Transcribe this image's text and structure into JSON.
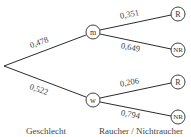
{
  "diagram": {
    "type": "probability-tree",
    "root": {
      "x": 4,
      "y": 66
    },
    "level1": [
      {
        "id": "m",
        "label": "m",
        "x": 93,
        "y": 32,
        "probability": "0,478"
      },
      {
        "id": "w",
        "label": "w",
        "x": 93,
        "y": 100,
        "probability": "0,522"
      }
    ],
    "level2": [
      {
        "parent": "m",
        "label": "R",
        "x": 178,
        "y": 14,
        "probability": "0,351"
      },
      {
        "parent": "m",
        "label": "NR",
        "x": 178,
        "y": 50,
        "probability": "0,649"
      },
      {
        "parent": "w",
        "label": "R",
        "x": 178,
        "y": 82,
        "probability": "0,206"
      },
      {
        "parent": "w",
        "label": "NR",
        "x": 178,
        "y": 117,
        "probability": "0,794"
      }
    ],
    "captions": {
      "level1": "Geschlecht",
      "level2": "Raucher / Nichtraucher"
    },
    "colors": {
      "line": "#2b2b2b",
      "text": "#444444",
      "background": "#ffffff"
    }
  }
}
